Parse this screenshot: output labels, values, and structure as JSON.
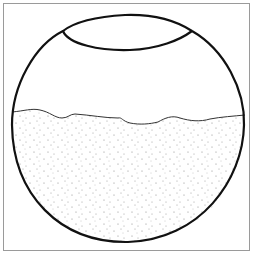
{
  "figure": {
    "colors": {
      "outline": "#111111",
      "frame": "#9a9a9a",
      "speckle": "#8a8a8a",
      "background": "#ffffff"
    }
  }
}
